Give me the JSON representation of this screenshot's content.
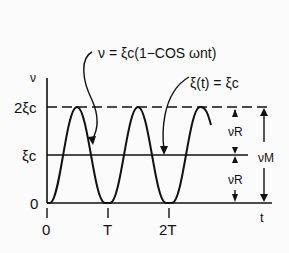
{
  "diagram": {
    "equation_response": "ν = ξc(1−COS ωnt)",
    "equation_input": "ξ(t) = ξc",
    "y_axis_label": "ν",
    "x_axis_label": "t",
    "y_ticks": [
      "2ξc",
      "ξc",
      "0"
    ],
    "x_ticks": [
      "0",
      "T",
      "2T"
    ],
    "amplitude_label_upper": "νR",
    "amplitude_label_lower": "νR",
    "max_label": "νM"
  },
  "colors": {
    "ink": "#111111",
    "background": "#fbfbfb"
  }
}
